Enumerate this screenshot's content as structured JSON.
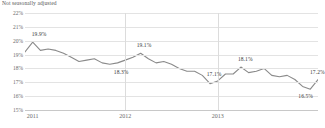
{
  "subtitle": "Not seasonally adjusted",
  "colors": {
    "line": "#8a8a8a",
    "grid": "#e3e3e3",
    "axis": "#c8c8c8",
    "text": "#6a6a6a",
    "label": "#3a3a3a"
  },
  "chart_data": {
    "type": "line",
    "title": "",
    "subtitle": "Not seasonally adjusted",
    "xlabel": "",
    "ylabel": "",
    "ylim": [
      15,
      22
    ],
    "yticks": [
      15,
      16,
      17,
      18,
      19,
      20,
      21,
      22
    ],
    "ytick_labels": [
      "15%",
      "16%",
      "17%",
      "18%",
      "19%",
      "20%",
      "21%",
      "22%"
    ],
    "grid": true,
    "legend": "none",
    "xtick_labels": [
      "2011",
      "2012",
      "2013"
    ],
    "xtick_positions": [
      1,
      13,
      25
    ],
    "x": [
      0,
      1,
      2,
      3,
      4,
      5,
      6,
      7,
      8,
      9,
      10,
      11,
      12,
      13,
      14,
      15,
      16,
      17,
      18,
      19,
      20,
      21,
      22,
      23,
      24,
      25,
      26,
      27,
      28,
      29,
      30,
      31,
      32,
      33,
      34,
      35,
      36,
      37,
      38
    ],
    "series": [
      {
        "name": "Rate",
        "values": [
          19.2,
          19.9,
          19.3,
          19.4,
          19.3,
          19.1,
          18.8,
          18.5,
          18.6,
          18.7,
          18.4,
          18.3,
          18.4,
          18.6,
          18.8,
          19.1,
          18.7,
          18.4,
          18.5,
          18.3,
          18.0,
          17.8,
          17.8,
          17.5,
          16.9,
          17.1,
          17.6,
          17.6,
          18.1,
          17.7,
          17.8,
          18.0,
          17.5,
          17.4,
          17.5,
          17.2,
          16.7,
          16.5,
          17.2
        ]
      }
    ],
    "point_labels": [
      {
        "index": 1,
        "text": "19.9%",
        "dx": -1,
        "dy": -11
      },
      {
        "index": 11,
        "text": "18.3%",
        "dx": 4,
        "dy": 5
      },
      {
        "index": 15,
        "text": "19.1%",
        "dx": -4,
        "dy": -11
      },
      {
        "index": 25,
        "text": "17.1%",
        "dx": -11,
        "dy": -10
      },
      {
        "index": 28,
        "text": "18.1%",
        "dx": -3,
        "dy": -11
      },
      {
        "index": 37,
        "text": "16.5%",
        "dx": -12,
        "dy": 4
      },
      {
        "index": 38,
        "text": "17.2%",
        "dx": -8,
        "dy": -11
      }
    ]
  }
}
